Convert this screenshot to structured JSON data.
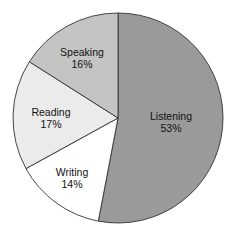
{
  "chart_data": {
    "type": "pie",
    "title": "",
    "start_angle_deg": 0,
    "direction": "clockwise",
    "slices": [
      {
        "label": "Listening",
        "value": 53,
        "display": "53%",
        "color": "#9a9a9a"
      },
      {
        "label": "Writing",
        "value": 14,
        "display": "14%",
        "color": "#ffffff"
      },
      {
        "label": "Reading",
        "value": 17,
        "display": "17%",
        "color": "#ebebeb"
      },
      {
        "label": "Speaking",
        "value": 16,
        "display": "16%",
        "color": "#c4c4c4"
      }
    ],
    "categories": [
      "Listening",
      "Writing",
      "Reading",
      "Speaking"
    ],
    "values": [
      53,
      14,
      17,
      16
    ],
    "legend": "none (labels inside slices)"
  },
  "labels": {
    "listening": {
      "name": "Listening",
      "pct": "53%"
    },
    "writing": {
      "name": "Writing",
      "pct": "14%"
    },
    "reading": {
      "name": "Reading",
      "pct": "17%"
    },
    "speaking": {
      "name": "Speaking",
      "pct": "16%"
    }
  }
}
